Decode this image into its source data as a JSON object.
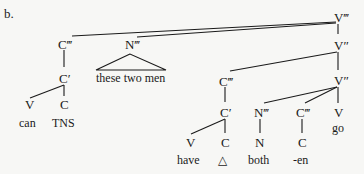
{
  "example_label": "b.",
  "nodes": {
    "v3_root": "V‴",
    "v2_upper": "V″",
    "v2_lower": "V″",
    "c3_left": "C‴",
    "n3_left": "N‴",
    "c1_left": "C′",
    "v_can": "V",
    "c_tns": "C",
    "c3_mid": "C‴",
    "c1_mid": "C′",
    "v_have": "V",
    "c_delta": "C",
    "n3_mid": "N‴",
    "n_both": "N",
    "c3_right": "C‴",
    "c_en": "C",
    "v_go": "V"
  },
  "words": {
    "can": "can",
    "tns": "TNS",
    "these_two_men": "these two men",
    "have": "have",
    "delta": "△",
    "both": "both",
    "en": "-en",
    "go": "go"
  }
}
